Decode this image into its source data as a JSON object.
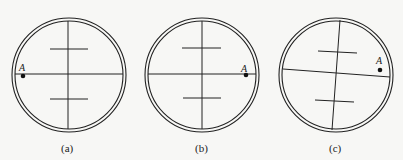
{
  "figure": {
    "panels": [
      {
        "id": "a",
        "label": "(a)",
        "point_label": "A",
        "cx": 69,
        "cy": 75,
        "point": [
          23,
          76
        ],
        "point_label_pos": [
          20,
          71
        ],
        "tilt_deg": 0
      },
      {
        "id": "b",
        "label": "(b)",
        "point_label": "A",
        "cx": 202,
        "cy": 75,
        "point": [
          246,
          75
        ],
        "point_label_pos": [
          242,
          71
        ],
        "tilt_deg": 0
      },
      {
        "id": "c",
        "label": "(c)",
        "point_label": "A",
        "cx": 336,
        "cy": 75,
        "point": [
          380,
          71
        ],
        "point_label_pos": [
          377,
          63
        ],
        "tilt_deg": 4
      }
    ],
    "colors": {
      "line": "#222222",
      "background": "#f7f7f5"
    }
  }
}
